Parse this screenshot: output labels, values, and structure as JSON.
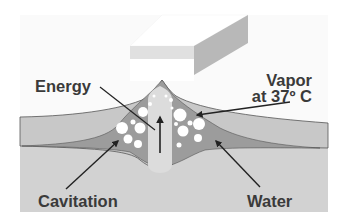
{
  "diagram": {
    "title": "",
    "labels": {
      "energy": "Energy",
      "vapor_line1": "Vapor",
      "vapor_line2": "at 37º C",
      "cavitation": "Cavitation",
      "water": "Water"
    },
    "colors": {
      "background": "#fafafa",
      "probe_top": "#ffffff",
      "probe_band": "#e0e0e0",
      "probe_side": "#b8b8b8",
      "upper_tissue": "#c8c8c8",
      "water_region": "#9c9c9c",
      "lower_tissue": "#d2d2d2",
      "bubble": "#ffffff",
      "arrow": "#222222",
      "label_text": "#3a3a3a"
    }
  }
}
